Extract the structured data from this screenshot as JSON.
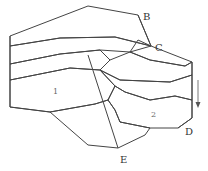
{
  "diagram": {
    "type": "geological-block-diagram",
    "labels": {
      "B": "B",
      "C": "C",
      "D": "D",
      "E": "E"
    },
    "block_numbers": {
      "left_block": "1",
      "right_block": "2"
    },
    "arrow": {
      "direction": "down",
      "meaning": "displacement"
    },
    "layers": [
      {
        "name": "top-layer",
        "pattern": "v-checks"
      },
      {
        "name": "second-layer",
        "pattern": "diagonal-hatch"
      },
      {
        "name": "third-layer",
        "pattern": "coarse-dots"
      },
      {
        "name": "fourth-layer",
        "pattern": "fine-dots"
      },
      {
        "name": "fault-plane",
        "pattern": "diagonal-hatch"
      }
    ],
    "colors": {
      "line": "#444444",
      "background": "#ffffff",
      "text": "#333333"
    }
  }
}
